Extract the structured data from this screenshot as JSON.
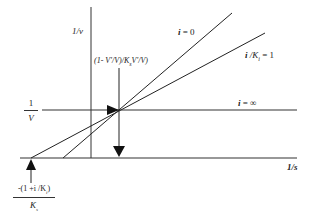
{
  "diagram": {
    "type": "lineweaver-burk-plot",
    "title": "",
    "axes": {
      "y_label": "1/v",
      "x_label": "1/s"
    },
    "lines": [
      {
        "label_var": "i",
        "label_rest": " = 0",
        "id": "i-zero"
      },
      {
        "label_var": "i",
        "label_mid": " /K",
        "label_sub": "i",
        "label_rest": " = 1",
        "id": "i-over-ki-one"
      },
      {
        "label_var": "i",
        "label_rest": " = ∞",
        "id": "i-infinity"
      }
    ],
    "annotations": {
      "intersection_label": "(1- V'/V)/K",
      "intersection_label_sub": "s",
      "intersection_label_tail": "V'/V)",
      "y_intercept_num": "1",
      "y_intercept_den": "V",
      "x_intercept_num": "-(1 +i /K",
      "x_intercept_num_sub": "i",
      "x_intercept_num_tail": ")",
      "x_intercept_den": "K",
      "x_intercept_den_sub": "s"
    },
    "colors": {
      "line": "#222222",
      "background": "#ffffff"
    }
  }
}
